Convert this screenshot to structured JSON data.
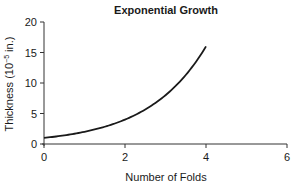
{
  "chart_data": {
    "type": "line",
    "title": "Exponential Growth",
    "xlabel": "Number of Folds",
    "ylabel": "Thickness (10⁻⁵ in.)",
    "ylabel_parts": {
      "base": "Thickness (10",
      "exp": "−5",
      "suffix": " in.)"
    },
    "xlim": [
      0,
      6
    ],
    "ylim": [
      0,
      20
    ],
    "xticks": [
      0,
      2,
      4,
      6
    ],
    "yticks": [
      0,
      5,
      10,
      15,
      20
    ],
    "grid": false,
    "legend": null,
    "series": [
      {
        "name": "Thickness",
        "x": [
          0,
          0.5,
          1,
          1.5,
          2,
          2.5,
          3,
          3.5,
          4
        ],
        "y": [
          1,
          1.41,
          2,
          2.83,
          4,
          5.66,
          8,
          11.31,
          16
        ],
        "color": "#1a1a1a"
      }
    ]
  }
}
